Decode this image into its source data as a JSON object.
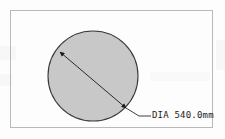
{
  "drawing": {
    "title": "Circular part diameter dimension drawing",
    "background_color": "#fdfdfd",
    "frame": {
      "label": "drawing border",
      "stroke_color": "#b9b9b9"
    },
    "shape": {
      "type": "circle",
      "name": "circular part outline",
      "fill_color": "#c8c8c8",
      "stroke_color": "#3a3a3a",
      "center_x": 93,
      "center_y": 76,
      "radius": 45
    },
    "dimension": {
      "name": "diameter dimension",
      "label": "DIA 540.0mm",
      "value": 540.0,
      "unit": "mm",
      "prefix": "DIA",
      "line_color": "#2a2a2a",
      "arrow_style": "filled-double-arrow",
      "start_point": [
        60,
        52
      ],
      "end_point": [
        126,
        108
      ],
      "leader_elbow": [
        139,
        116
      ],
      "leader_end": [
        151,
        116
      ]
    }
  }
}
